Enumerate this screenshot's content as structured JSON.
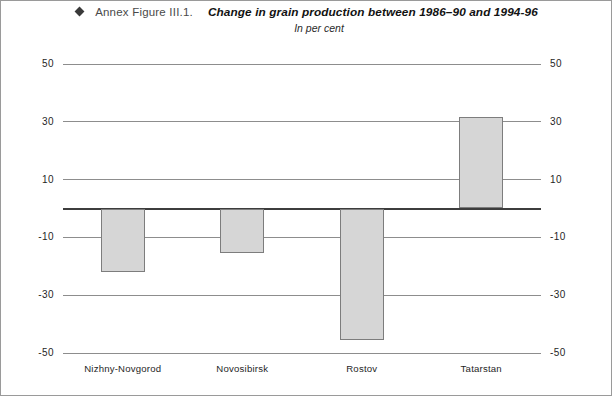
{
  "header": {
    "bullet_icon": "diamond-bullet-icon",
    "figure_number": "Annex Figure III.1.",
    "title": "Change in grain production between 1986–90 and 1994-96",
    "subtitle": "In per cent"
  },
  "chart_data": {
    "type": "bar",
    "title": "Change in grain production between 1986–90 and 1994-96",
    "subtitle": "In per cent",
    "xlabel": "",
    "ylabel": "",
    "categories": [
      "Nizhny-Novgorod",
      "Novosibirsk",
      "Rostov",
      "Tatarstan"
    ],
    "values": [
      -22,
      -15.5,
      -45.5,
      31.5
    ],
    "ylim": [
      -50,
      50
    ],
    "yticks": [
      50,
      30,
      10,
      -10,
      -30,
      -50
    ],
    "ytick_labels": [
      "50",
      "30",
      "10",
      "-10",
      "-30",
      "-50"
    ],
    "zero_line": 0,
    "grid": true,
    "dual_axis": true,
    "legend": "none",
    "bar_fill": "#d6d6d6",
    "bar_stroke": "#7d7d7d"
  }
}
